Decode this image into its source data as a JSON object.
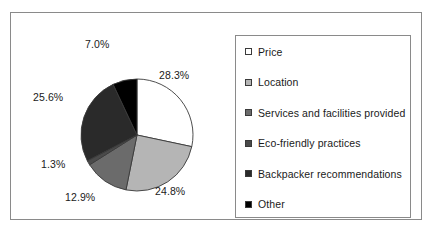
{
  "chart_data": {
    "type": "pie",
    "title": "",
    "start_angle_deg": 0,
    "direction": "clockwise",
    "categories": [
      "Price",
      "Location",
      "Services and facilities provided",
      "Eco-friendly practices",
      "Backpacker recommendations",
      "Other"
    ],
    "values": [
      28.3,
      24.8,
      12.9,
      1.3,
      25.6,
      7.0
    ],
    "value_labels": [
      "28.3%",
      "24.8%",
      "12.9%",
      "1.3%",
      "25.6%",
      "7.0%"
    ],
    "colors": [
      "#ffffff",
      "#b5b5b5",
      "#6b6b6b",
      "#4a4a4a",
      "#2a2a2a",
      "#000000"
    ],
    "legend_position": "right",
    "grid": false
  },
  "legend": {
    "items": [
      {
        "label": "Price",
        "color": "#ffffff"
      },
      {
        "label": "Location",
        "color": "#b5b5b5"
      },
      {
        "label": "Services and facilities provided",
        "color": "#6b6b6b"
      },
      {
        "label": "Eco-friendly practices",
        "color": "#4a4a4a"
      },
      {
        "label": "Backpacker recommendations",
        "color": "#2a2a2a"
      },
      {
        "label": "Other",
        "color": "#000000"
      }
    ]
  },
  "slice_labels": {
    "price": "28.3%",
    "location": "24.8%",
    "services": "12.9%",
    "eco": "1.3%",
    "backpacker": "25.6%",
    "other": "7.0%"
  }
}
